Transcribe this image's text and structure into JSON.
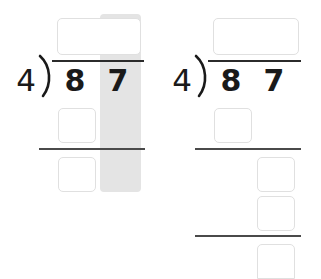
{
  "worksheet": {
    "title": "Long division worksheet — two stages of 87 ÷ 4",
    "background_color": "#ffffff",
    "ink_color": "#1a1a1a",
    "rule_color": "#4a4a4a",
    "box_border_color": "#e0e0e0",
    "highlight_color": "#e4e4e4"
  },
  "problems": [
    {
      "id": "left",
      "name": "division-problem-left",
      "divisor": "4",
      "bracket_glyph": ")",
      "dividend_digits": [
        "8",
        "7"
      ],
      "highlight_column": "ones",
      "boxes": [
        {
          "name": "quotient-box",
          "value": "",
          "placeholder": "",
          "span": "two-digit"
        },
        {
          "name": "partial-product-box",
          "value": "",
          "placeholder": "",
          "span": "tens"
        },
        {
          "name": "difference-box",
          "value": "",
          "placeholder": "",
          "span": "tens"
        }
      ],
      "rules": [
        {
          "name": "division-vinculum"
        },
        {
          "name": "subtraction-rule-1"
        }
      ]
    },
    {
      "id": "right",
      "name": "division-problem-right",
      "divisor": "4",
      "bracket_glyph": ")",
      "dividend_digits": [
        "8",
        "7"
      ],
      "highlight_column": "none",
      "boxes": [
        {
          "name": "quotient-box",
          "value": "",
          "placeholder": "",
          "span": "two-digit"
        },
        {
          "name": "partial-product-box",
          "value": "",
          "placeholder": "",
          "span": "tens"
        },
        {
          "name": "difference-box",
          "value": "",
          "placeholder": "",
          "span": "ones"
        },
        {
          "name": "brought-down-box",
          "value": "",
          "placeholder": "",
          "span": "ones"
        },
        {
          "name": "remainder-box",
          "value": "",
          "placeholder": "",
          "span": "ones"
        }
      ],
      "rules": [
        {
          "name": "division-vinculum"
        },
        {
          "name": "subtraction-rule-1"
        },
        {
          "name": "subtraction-rule-2"
        }
      ]
    }
  ]
}
